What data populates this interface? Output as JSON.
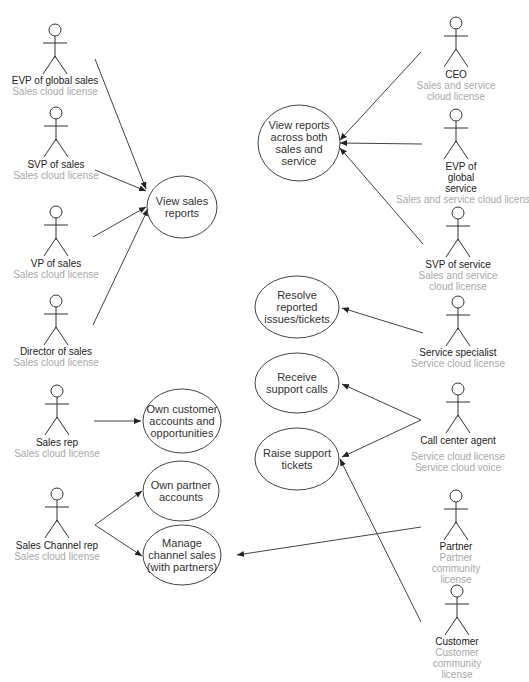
{
  "diagram": {
    "type": "use-case",
    "colors": {
      "stroke": "#444444",
      "name_text": "#222222",
      "license_text": "#a9a9a9",
      "background": "#ffffff"
    },
    "actors": [
      {
        "id": "evp_sales",
        "name": "EVP of global sales",
        "license": "Sales cloud license"
      },
      {
        "id": "svp_sales",
        "name": "SVP of sales",
        "license": "Sales cloud license"
      },
      {
        "id": "vp_sales",
        "name": "VP of sales",
        "license": "Sales cloud license"
      },
      {
        "id": "dir_sales",
        "name": "Director of sales",
        "license": "Sales cloud license"
      },
      {
        "id": "sales_rep",
        "name": "Sales rep",
        "license": "Sales cloud license"
      },
      {
        "id": "channel_rep",
        "name": "Sales Channel rep",
        "license": "Sales cloud license"
      },
      {
        "id": "ceo",
        "name": "CEO",
        "license": "Sales and service cloud license"
      },
      {
        "id": "evp_service",
        "name": "EVP of global service",
        "license": "Sales and service cloud license"
      },
      {
        "id": "svp_service",
        "name": "SVP of service",
        "license": "Sales and service cloud license"
      },
      {
        "id": "specialist",
        "name": "Service specialist",
        "license": "Service cloud license"
      },
      {
        "id": "call_agent",
        "name": "Call center agent",
        "license": "Service cloud license",
        "license2": "Service cloud voice"
      },
      {
        "id": "partner",
        "name": "Partner",
        "license": "Partner community license"
      },
      {
        "id": "customer",
        "name": "Customer",
        "license": "Customer community license"
      }
    ],
    "use_cases": [
      {
        "id": "view_sales",
        "label": "View sales reports"
      },
      {
        "id": "own_customer",
        "label": "Own customer accounts and opportunities"
      },
      {
        "id": "own_partner",
        "label": "Own partner accounts"
      },
      {
        "id": "manage_channel",
        "label": "Manage channel sales (with partners)"
      },
      {
        "id": "view_both",
        "label": "View reports across both sales and service"
      },
      {
        "id": "resolve",
        "label": "Resolve reported issues/tickets"
      },
      {
        "id": "receive_calls",
        "label": "Receive support calls"
      },
      {
        "id": "raise_tickets",
        "label": "Raise support tickets"
      }
    ],
    "associations": [
      [
        "evp_sales",
        "view_sales"
      ],
      [
        "svp_sales",
        "view_sales"
      ],
      [
        "vp_sales",
        "view_sales"
      ],
      [
        "dir_sales",
        "view_sales"
      ],
      [
        "sales_rep",
        "own_customer"
      ],
      [
        "channel_rep",
        "own_partner"
      ],
      [
        "channel_rep",
        "manage_channel"
      ],
      [
        "ceo",
        "view_both"
      ],
      [
        "evp_service",
        "view_both"
      ],
      [
        "svp_service",
        "view_both"
      ],
      [
        "specialist",
        "resolve"
      ],
      [
        "call_agent",
        "receive_calls"
      ],
      [
        "call_agent",
        "raise_tickets"
      ],
      [
        "partner",
        "manage_channel"
      ],
      [
        "customer",
        "raise_tickets"
      ]
    ]
  }
}
